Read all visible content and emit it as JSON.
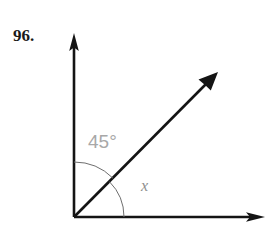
{
  "figure": {
    "problem_number": "96.",
    "vertex": {
      "x": 74,
      "y": 217
    },
    "rays": [
      {
        "name": "vertical-ray",
        "angle_deg": 90,
        "length": 182,
        "tip": {
          "x": 74,
          "y": 35
        }
      },
      {
        "name": "diagonal-ray",
        "angle_deg": 45,
        "length": 203,
        "tip": {
          "x": 218,
          "y": 72
        }
      },
      {
        "name": "horizontal-ray",
        "angle_deg": 0,
        "length": 190,
        "tip": {
          "x": 264,
          "y": 217
        }
      }
    ],
    "arcs": [
      {
        "name": "angle-arc-45",
        "radius": 55,
        "start_deg": 45,
        "end_deg": 90,
        "label": "45°"
      },
      {
        "name": "angle-arc-x",
        "radius": 50,
        "start_deg": 0,
        "end_deg": 45,
        "label": "x"
      }
    ],
    "labels": {
      "known_angle": "45°",
      "unknown_angle": "x"
    },
    "colors": {
      "ray_stroke": "#141414",
      "arc_stroke": "#6e6e6e",
      "known_angle_text": "#a8a8a8",
      "unknown_angle_text": "#8e8e8e",
      "number_text": "#1a1a1a",
      "background": "#ffffff"
    }
  }
}
